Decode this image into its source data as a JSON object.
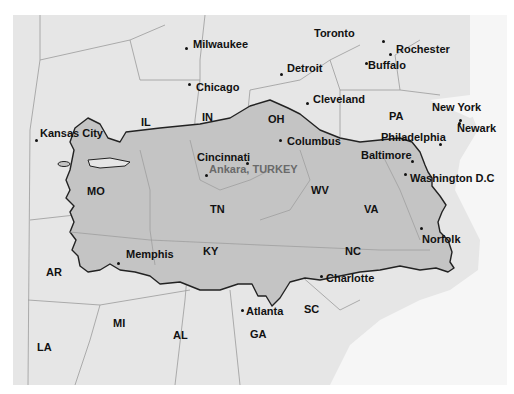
{
  "map": {
    "title": "Ankara, TURKEY",
    "overlay": "Turkey silhouette over eastern United States",
    "colors": {
      "land": "#e6e6e6",
      "overlay": "#c2c2c2",
      "border": "#222222",
      "state_lines": "#9a9a9a",
      "ocean": "#f7f7f7"
    },
    "cities": [
      {
        "name": "Milwaukee",
        "x": 186,
        "y": 48,
        "lx": 193,
        "ly": 38
      },
      {
        "name": "Chicago",
        "x": 189,
        "y": 84,
        "lx": 196,
        "ly": 81
      },
      {
        "name": "Toronto",
        "x": 383,
        "y": 41,
        "lx": 314,
        "ly": 27
      },
      {
        "name": "Rochester",
        "x": 390,
        "y": 54,
        "lx": 396,
        "ly": 43
      },
      {
        "name": "Buffalo",
        "x": 366,
        "y": 63,
        "lx": 368,
        "ly": 59
      },
      {
        "name": "Detroit",
        "x": 281,
        "y": 74,
        "lx": 287,
        "ly": 62
      },
      {
        "name": "Cleveland",
        "x": 307,
        "y": 103,
        "lx": 313,
        "ly": 93
      },
      {
        "name": "Kansas City",
        "x": 36,
        "y": 140,
        "lx": 40,
        "ly": 127
      },
      {
        "name": "Columbus",
        "x": 280,
        "y": 140,
        "lx": 287,
        "ly": 135
      },
      {
        "name": "New York",
        "x": 459,
        "y": 123,
        "lx": 432,
        "ly": 101
      },
      {
        "name": "Newark",
        "x": 460,
        "y": 120,
        "lx": 457,
        "ly": 122
      },
      {
        "name": "Philadelphia",
        "x": 440,
        "y": 144,
        "lx": 381,
        "ly": 131
      },
      {
        "name": "Cincinnati",
        "x": 247,
        "y": 163,
        "lx": 197,
        "ly": 151
      },
      {
        "name": "Baltimore",
        "x": 412,
        "y": 161,
        "lx": 361,
        "ly": 149
      },
      {
        "name": "Washington D.C",
        "x": 405,
        "y": 174,
        "lx": 410,
        "ly": 172
      },
      {
        "name": "Memphis",
        "x": 118,
        "y": 263,
        "lx": 126,
        "ly": 248
      },
      {
        "name": "Norfolk",
        "x": 421,
        "y": 228,
        "lx": 422,
        "ly": 233
      },
      {
        "name": "Charlotte",
        "x": 321,
        "y": 276,
        "lx": 326,
        "ly": 272
      },
      {
        "name": "Atlanta",
        "x": 242,
        "y": 310,
        "lx": 246,
        "ly": 305
      }
    ],
    "capital": {
      "name": "Ankara, TURKEY",
      "x": 206,
      "y": 175,
      "lx": 209,
      "ly": 163
    },
    "states": [
      {
        "abbr": "IL",
        "x": 141,
        "y": 116
      },
      {
        "abbr": "IN",
        "x": 202,
        "y": 111
      },
      {
        "abbr": "OH",
        "x": 268,
        "y": 113
      },
      {
        "abbr": "PA",
        "x": 389,
        "y": 110
      },
      {
        "abbr": "MO",
        "x": 87,
        "y": 185
      },
      {
        "abbr": "TN",
        "x": 210,
        "y": 203
      },
      {
        "abbr": "WV",
        "x": 311,
        "y": 184
      },
      {
        "abbr": "VA",
        "x": 364,
        "y": 203
      },
      {
        "abbr": "KY",
        "x": 203,
        "y": 245
      },
      {
        "abbr": "NC",
        "x": 345,
        "y": 245
      },
      {
        "abbr": "AR",
        "x": 46,
        "y": 266
      },
      {
        "abbr": "MI",
        "x": 113,
        "y": 317
      },
      {
        "abbr": "AL",
        "x": 173,
        "y": 329
      },
      {
        "abbr": "SC",
        "x": 304,
        "y": 303
      },
      {
        "abbr": "GA",
        "x": 250,
        "y": 328
      },
      {
        "abbr": "LA",
        "x": 37,
        "y": 341
      }
    ]
  }
}
